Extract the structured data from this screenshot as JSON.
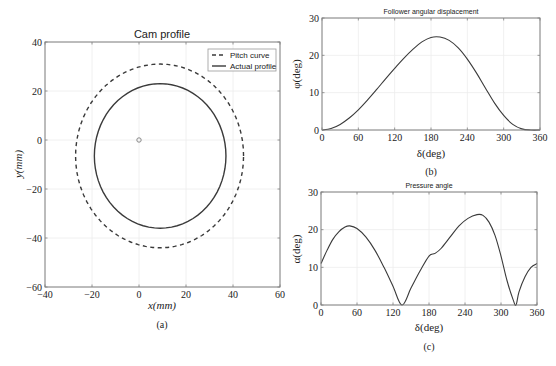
{
  "chart_data": [
    {
      "id": "a",
      "type": "line",
      "title": "Cam profile",
      "caption": "(a)",
      "xlabel": "x(mm)",
      "ylabel": "y(mm)",
      "xlim": [
        -40,
        60
      ],
      "ylim": [
        -60,
        40
      ],
      "xticks": [
        -40,
        -20,
        0,
        20,
        40,
        60
      ],
      "yticks": [
        -60,
        -40,
        -20,
        0,
        20,
        40
      ],
      "grid": true,
      "legend_position": "top-right",
      "center_marker": {
        "x": 0,
        "y": 0
      },
      "series": [
        {
          "name": "Pitch curve",
          "style": "dashed",
          "shape": {
            "cx": 9,
            "cy": -6.5,
            "rx_left": 36,
            "rx_right": 35.5,
            "ry_top": 37.5,
            "ry_bottom": 37.5
          }
        },
        {
          "name": "Actual profile",
          "style": "solid",
          "shape": {
            "cx": 9,
            "cy": -6.5,
            "rx_left": 28,
            "rx_right": 28,
            "ry_top": 29.5,
            "ry_bottom": 29.5
          }
        }
      ]
    },
    {
      "id": "b",
      "type": "line",
      "title": "Follower angular displacement",
      "caption": "(b)",
      "xlabel": "δ(deg)",
      "ylabel": "φ(deg)",
      "xlim": [
        0,
        360
      ],
      "ylim": [
        0,
        30
      ],
      "xticks": [
        0,
        60,
        120,
        180,
        240,
        300,
        360
      ],
      "yticks": [
        0,
        10,
        20,
        30
      ],
      "grid": true,
      "series": [
        {
          "name": "Angular displacement",
          "x": [
            0,
            15,
            30,
            45,
            60,
            75,
            90,
            105,
            120,
            135,
            150,
            165,
            180,
            195,
            210,
            225,
            240,
            255,
            270,
            285,
            300,
            315,
            330,
            345,
            360
          ],
          "y": [
            0,
            0.4,
            1.5,
            3.2,
            5.4,
            8.0,
            10.8,
            13.7,
            16.5,
            19.2,
            21.6,
            23.6,
            24.8,
            24.9,
            24.0,
            22.0,
            19.0,
            15.3,
            11.2,
            7.2,
            3.9,
            1.5,
            0.3,
            0,
            0
          ]
        }
      ]
    },
    {
      "id": "c",
      "type": "line",
      "title": "Pressure angle",
      "caption": "(c)",
      "xlabel": "δ(deg)",
      "ylabel": "α(deg)",
      "xlim": [
        0,
        360
      ],
      "ylim": [
        0,
        30
      ],
      "xticks": [
        0,
        60,
        120,
        180,
        240,
        300,
        360
      ],
      "yticks": [
        0,
        10,
        20,
        30
      ],
      "grid": true,
      "series": [
        {
          "name": "Pressure angle",
          "x": [
            0,
            10,
            20,
            30,
            40,
            48,
            60,
            75,
            90,
            105,
            120,
            135,
            150,
            165,
            180,
            190,
            200,
            215,
            230,
            245,
            260,
            270,
            280,
            290,
            300,
            310,
            320,
            325,
            330,
            340,
            350,
            360
          ],
          "y": [
            11,
            14.5,
            17.5,
            19.5,
            20.7,
            21,
            20.3,
            18,
            14.5,
            10,
            5,
            0,
            4.5,
            9,
            13,
            13.7,
            15,
            18,
            21,
            23,
            24,
            23.8,
            22,
            18.5,
            13,
            6.5,
            1.5,
            0,
            3.5,
            7.5,
            10,
            11
          ]
        }
      ]
    }
  ],
  "legend": {
    "pitch_label": "Pitch curve",
    "actual_label": "Actual profile"
  },
  "captions": {
    "a": "(a)",
    "b": "(b)",
    "c": "(c)"
  },
  "titles": {
    "a": "Cam profile",
    "b": "Follower angular displacement",
    "c": "Pressure angle"
  },
  "labels": {
    "a_x": "x(mm)",
    "a_y": "y(mm)",
    "b_x": "δ(deg)",
    "b_y": "φ(deg)",
    "c_x": "δ(deg)",
    "c_y": "α(deg)"
  },
  "colors": {
    "line": "#3a3a3a",
    "axis": "#808080",
    "grid": "#ececec",
    "marker": "#888888"
  }
}
